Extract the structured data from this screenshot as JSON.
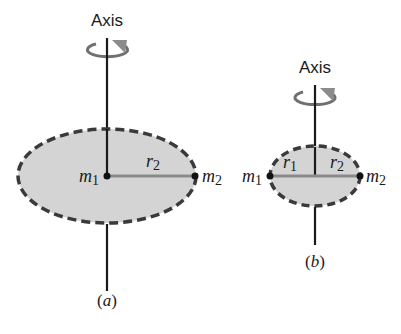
{
  "colors": {
    "disk_fill": "#d4d4d4",
    "disk_edge": "#3a3a3a",
    "axis_line": "#1a1a1a",
    "radius_line": "#8a8a8a",
    "rotation_arrow": "#707070",
    "arrow_head": "#8c8c8c",
    "mass_dot": "#111111",
    "text": "#1a1a1a"
  },
  "panel_a": {
    "axis_label": "Axis",
    "mass_1": {
      "symbol": "m",
      "sub": "1"
    },
    "mass_2": {
      "symbol": "m",
      "sub": "2"
    },
    "radius_2": {
      "symbol": "r",
      "sub": "2"
    },
    "caption_open": "(",
    "caption_letter": "a",
    "caption_close": ")"
  },
  "panel_b": {
    "axis_label": "Axis",
    "mass_1": {
      "symbol": "m",
      "sub": "1"
    },
    "mass_2": {
      "symbol": "m",
      "sub": "2"
    },
    "radius_1": {
      "symbol": "r",
      "sub": "1"
    },
    "radius_2": {
      "symbol": "r",
      "sub": "2"
    },
    "caption_open": "(",
    "caption_letter": "b",
    "caption_close": ")"
  }
}
